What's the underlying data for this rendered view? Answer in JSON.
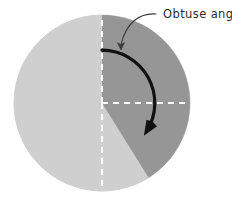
{
  "figure": {
    "kind": "geometry-diagram",
    "background_color": "#ffffff"
  },
  "annotation": {
    "label": "Obtuse angle",
    "label_color": "#2b2b2b",
    "leader_color": "#3a3a3a"
  },
  "circle": {
    "center_x": 102,
    "center_y": 103,
    "radius": 88,
    "fill_light": "#cfcfcf",
    "fill_dark": "#969696",
    "edge_color": "#cfcfcf"
  },
  "sectors": [
    {
      "name": "dark-left-half",
      "color": "#969696",
      "start_angle_deg": 90,
      "end_angle_deg": 270
    },
    {
      "name": "dark-lower-wedge",
      "color": "#969696",
      "start_angle_deg": 238,
      "end_angle_deg": 270
    },
    {
      "name": "light-obtuse-sector",
      "color": "#cfcfcf",
      "start_angle_deg": 90,
      "end_angle_deg": -58
    }
  ],
  "dashed_radii": [
    {
      "name": "radius-up",
      "angle_deg": 90,
      "color": "#ffffff"
    },
    {
      "name": "radius-down",
      "angle_deg": 270,
      "color": "#ffffff"
    },
    {
      "name": "radius-right",
      "angle_deg": 0,
      "color": "#ffffff"
    }
  ],
  "angle_arc": {
    "name": "obtuse-angle-arc",
    "color": "#111111",
    "stroke_width": 3.2,
    "start_angle_deg": 90,
    "end_angle_deg": -32,
    "sweep": "clockwise",
    "measure_deg": 122,
    "has_arrowhead": true
  },
  "chart_data": {
    "type": "pie",
    "title": "Obtuse angle",
    "categories": [
      "Obtuse angle (light sector)",
      "Remaining reflex (dark sector)"
    ],
    "values": [
      122,
      238
    ],
    "unit": "degrees",
    "colors": [
      "#cfcfcf",
      "#969696"
    ],
    "annotations": [
      "Obtuse angle"
    ],
    "legend": "none",
    "grid": false
  }
}
